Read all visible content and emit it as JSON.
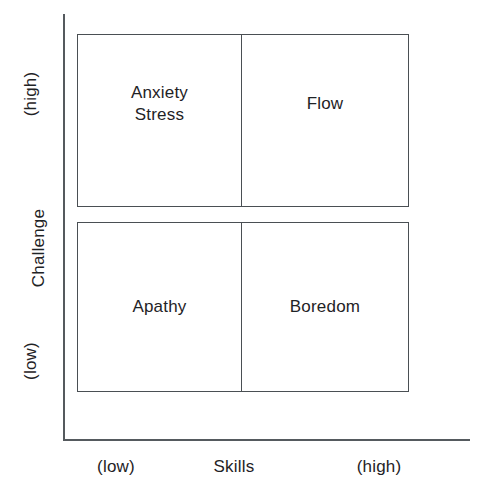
{
  "chart_data": {
    "type": "table",
    "title": "",
    "xlabel": "Skills",
    "ylabel": "Challenge",
    "x_ticks": [
      "(low)",
      "(high)"
    ],
    "y_ticks": [
      "(low)",
      "(high)"
    ],
    "grid": false,
    "legend": "none",
    "categories": [
      "low skills",
      "high skills"
    ],
    "rows": [
      {
        "challenge": "high",
        "cells": [
          {
            "label": "Anxiety\nStress",
            "skills": "low",
            "challenge": "high"
          },
          {
            "label": "Flow",
            "skills": "high",
            "challenge": "high"
          }
        ]
      },
      {
        "challenge": "low",
        "cells": [
          {
            "label": "Apathy",
            "skills": "low",
            "challenge": "low"
          },
          {
            "label": "Boredom",
            "skills": "high",
            "challenge": "low"
          }
        ]
      }
    ]
  },
  "axes": {
    "y": {
      "name": "Challenge",
      "high_tick": "(high)",
      "low_tick": "(low)"
    },
    "x": {
      "name": "Skills",
      "low_tick": "(low)",
      "high_tick": "(high)"
    }
  },
  "quadrants": {
    "top_left": "Anxiety\nStress",
    "top_right": "Flow",
    "bottom_left": "Apathy",
    "bottom_right": "Boredom"
  },
  "colors": {
    "background": "#ffffff",
    "line": "#4a4f53",
    "axis": "#555a5e",
    "text": "#1f2326"
  }
}
